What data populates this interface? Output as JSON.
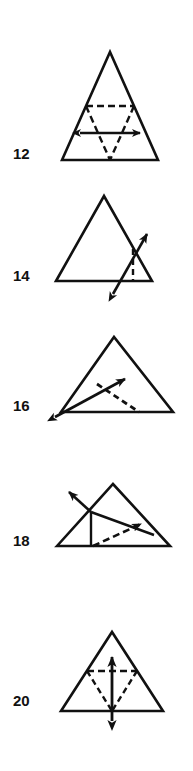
{
  "plate": {
    "kind": "geometry-figure-plate",
    "background_color": "#ffffff",
    "ink_color": "#111111",
    "width": 193,
    "height": 771,
    "description": "Five numbered triangle diagrams with arrows and dashed construction lines"
  },
  "figures": [
    {
      "label": "12",
      "label_x": 13,
      "label_y": 146,
      "name": "figure-12",
      "caption": "Triangle with dashed medial triangle and horizontal double-headed arrow",
      "solid_triangle": "62,160 110,52 158,160",
      "dashed_lines": [
        "86,106 134,106",
        "86,106 110,160",
        "134,106 110,160"
      ],
      "arrow": {
        "x1": 78,
        "y1": 133,
        "x2": 142,
        "y2": 133,
        "heads": "both",
        "style": "solid"
      }
    },
    {
      "label": "14",
      "label_x": 13,
      "label_y": 268,
      "name": "figure-14",
      "caption": "Triangle with a double-headed arrow crossing from below the base up past the right side, plus a dashed vertical segment",
      "solid_triangle": "56,280 104,196 152,280",
      "dashed_lines": [
        "136,248 136,280"
      ],
      "arrow": {
        "x1": 112,
        "y1": 296,
        "x2": 150,
        "y2": 230,
        "heads": "both",
        "style": "solid"
      }
    },
    {
      "label": "16",
      "label_x": 13,
      "label_y": 398,
      "name": "figure-16",
      "caption": "Triangle with a dashed cevian from the left side to the base and a double-headed arrow from the lower-left vertex",
      "solid_triangle": "62,412 113,337 172,412",
      "dashed_lines": [
        "96,385 138,412"
      ],
      "arrow": {
        "x1": 51,
        "y1": 419,
        "x2": 128,
        "y2": 377,
        "heads": "both",
        "style": "solid"
      }
    },
    {
      "label": "18",
      "label_x": 13,
      "label_y": 533,
      "name": "figure-18",
      "caption": "Triangle with an arrow to the upper left, a vertical segment to the base, a segment to the right side, and a dashed arrow down to the base",
      "solid_triangle": "57,545 113,485 170,545",
      "solid_lines": [
        "91,512 91,545",
        "91,512 153,535"
      ],
      "dashed_lines": [],
      "arrows": [
        {
          "x1": 91,
          "y1": 512,
          "x2": 66,
          "y2": 489,
          "heads": "start",
          "style": "solid"
        },
        {
          "x1": 91,
          "y1": 545,
          "x2": 146,
          "y2": 521,
          "heads": "end",
          "style": "dashed"
        }
      ]
    },
    {
      "label": "20",
      "label_x": 13,
      "label_y": 693,
      "name": "figure-20",
      "caption": "Triangle with dashed medial triangle and vertical double-headed arrow",
      "solid_triangle": "62,710 112,633 162,710",
      "dashed_lines": [
        "87,672 137,672",
        "87,672 112,710",
        "137,672 112,710"
      ],
      "arrow": {
        "x1": 112,
        "y1": 722,
        "x2": 112,
        "y2": 654,
        "heads": "both",
        "style": "solid"
      }
    }
  ]
}
